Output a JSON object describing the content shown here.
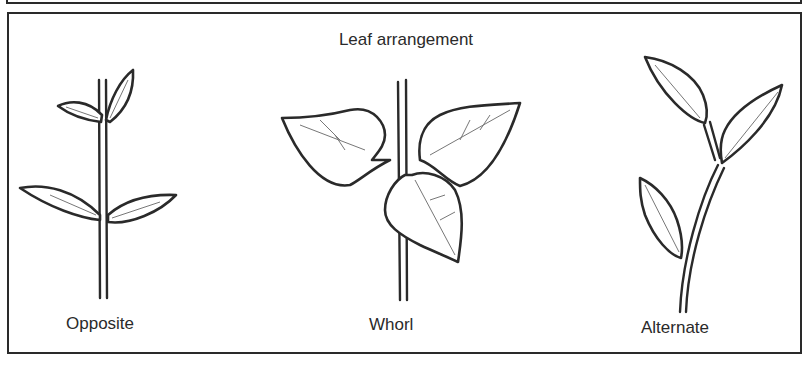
{
  "diagram": {
    "title": "Leaf arrangement",
    "panels": [
      {
        "id": "opposite",
        "label": "Opposite"
      },
      {
        "id": "whorl",
        "label": "Whorl"
      },
      {
        "id": "alternate",
        "label": "Alternate"
      }
    ]
  }
}
